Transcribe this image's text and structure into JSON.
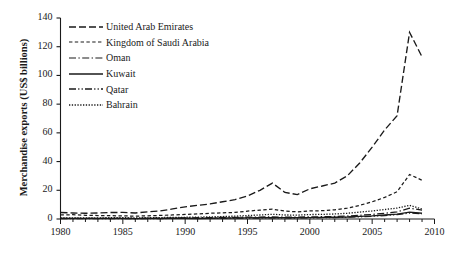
{
  "chart_data": {
    "type": "line",
    "title": "",
    "xlabel": "",
    "ylabel": "Merchandise exports (US$ billions)",
    "xlim": [
      1980,
      2010
    ],
    "ylim": [
      0,
      140
    ],
    "yticks": [
      0,
      20,
      40,
      60,
      80,
      100,
      120,
      140
    ],
    "xticks": [
      1980,
      1985,
      1990,
      1995,
      2000,
      2005,
      2010
    ],
    "minor_xticks_interval": 1,
    "grid": false,
    "legend_position": "upper-left-inside",
    "x": [
      1980,
      1981,
      1982,
      1983,
      1984,
      1985,
      1986,
      1987,
      1988,
      1989,
      1990,
      1991,
      1992,
      1993,
      1994,
      1995,
      1996,
      1997,
      1998,
      1999,
      2000,
      2001,
      2002,
      2003,
      2004,
      2005,
      2006,
      2007,
      2008,
      2009
    ],
    "series": [
      {
        "name": "United Arab Emirates",
        "dash": "long-dash",
        "values": [
          4.5,
          4.2,
          4.0,
          4.2,
          4.5,
          4.6,
          4.2,
          5.0,
          5.6,
          7.0,
          8.5,
          9.5,
          10.5,
          12.0,
          13.5,
          16.0,
          20.0,
          25.0,
          18.5,
          17.0,
          21.0,
          23.0,
          25.0,
          30.0,
          39.0,
          50.0,
          62.0,
          72.0,
          130.0,
          113.0
        ]
      },
      {
        "name": "Kingdom of Saudi Arabia",
        "dash": "short-dash",
        "values": [
          2.8,
          3.0,
          2.6,
          2.4,
          2.3,
          2.2,
          2.0,
          2.2,
          2.5,
          2.8,
          3.2,
          3.5,
          4.0,
          4.3,
          4.6,
          5.5,
          6.2,
          6.8,
          5.5,
          5.0,
          5.6,
          5.8,
          6.4,
          7.5,
          9.5,
          12.0,
          15.0,
          19.0,
          31.0,
          27.0
        ]
      },
      {
        "name": "Oman",
        "dash": "dash-dot",
        "values": [
          0.5,
          0.5,
          0.5,
          0.5,
          0.5,
          0.5,
          0.5,
          0.6,
          0.6,
          0.7,
          0.8,
          0.9,
          1.0,
          1.1,
          1.2,
          1.3,
          1.4,
          1.5,
          1.3,
          1.3,
          1.5,
          1.6,
          1.8,
          2.1,
          2.6,
          3.2,
          4.0,
          5.0,
          7.5,
          6.2
        ]
      },
      {
        "name": "Kuwait",
        "dash": "solid",
        "values": [
          0.4,
          0.4,
          0.4,
          0.4,
          0.4,
          0.4,
          0.3,
          0.4,
          0.4,
          0.5,
          0.5,
          0.3,
          0.5,
          0.6,
          0.7,
          0.8,
          0.9,
          1.0,
          0.9,
          0.9,
          1.0,
          1.1,
          1.2,
          1.4,
          1.8,
          2.2,
          2.8,
          3.4,
          4.8,
          4.0
        ]
      },
      {
        "name": "Qatar",
        "dash": "dash-dot-dot",
        "values": [
          0.3,
          0.3,
          0.3,
          0.3,
          0.3,
          0.3,
          0.3,
          0.3,
          0.3,
          0.4,
          0.4,
          0.4,
          0.5,
          0.5,
          0.6,
          0.6,
          0.7,
          0.8,
          0.7,
          0.7,
          0.8,
          0.9,
          1.0,
          1.2,
          1.5,
          1.9,
          2.4,
          3.0,
          4.2,
          3.6
        ]
      },
      {
        "name": "Bahrain",
        "dash": "dotted",
        "values": [
          0.8,
          0.8,
          0.8,
          0.8,
          0.9,
          0.9,
          0.8,
          0.9,
          1.0,
          1.1,
          1.2,
          1.3,
          1.5,
          1.7,
          2.0,
          2.4,
          2.8,
          3.3,
          2.8,
          2.7,
          3.1,
          3.2,
          3.5,
          4.0,
          4.8,
          5.6,
          6.6,
          7.6,
          9.5,
          7.0
        ]
      }
    ]
  },
  "axis": {
    "ylabel": "Merchandise exports (US$ billions)",
    "ytick_labels": [
      "0",
      "20",
      "40",
      "60",
      "80",
      "100",
      "120",
      "140"
    ],
    "xtick_labels": [
      "1980",
      "1985",
      "1990",
      "1995",
      "2000",
      "2005",
      "2010"
    ]
  },
  "legend": {
    "items": [
      {
        "label": "United Arab Emirates"
      },
      {
        "label": "Kingdom of Saudi Arabia"
      },
      {
        "label": "Oman"
      },
      {
        "label": "Kuwait"
      },
      {
        "label": "Qatar"
      },
      {
        "label": "Bahrain"
      }
    ]
  },
  "colors": {
    "ink": "#1a1a1a",
    "background": "#ffffff"
  }
}
